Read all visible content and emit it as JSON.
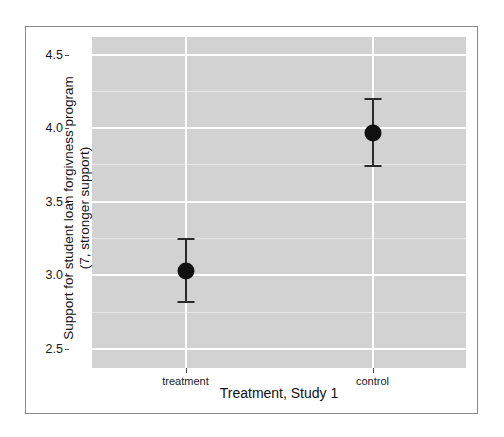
{
  "chart_data": {
    "type": "scatter",
    "title": "",
    "subtitle": "",
    "xlabel": "Treatment, Study 1",
    "ylabel_line1": "Support for student loan forgivness program",
    "ylabel_line2": "(7, stronger support)",
    "categories": [
      "treatment",
      "control"
    ],
    "values": [
      3.03,
      3.97
    ],
    "error_low": [
      2.82,
      3.74
    ],
    "error_high": [
      3.25,
      4.2
    ],
    "error_type": "95% confidence interval",
    "ylim": [
      2.37,
      4.62
    ],
    "yticks": [
      2.5,
      3.0,
      3.5,
      4.0,
      4.5
    ],
    "ytick_labels": [
      "2.5",
      "3.0",
      "3.5",
      "4.0",
      "4.5"
    ],
    "yticks_minor": [
      2.75,
      3.25,
      3.75,
      4.25
    ],
    "grid": true,
    "grid_color": "#ffffff",
    "panel_background": "#d2d2d2",
    "point_color": "#111111",
    "errorbar_color": "#2b2b2b",
    "legend": null,
    "legend_position": "none",
    "series": [
      {
        "name": "Mean support",
        "points": [
          {
            "category": "treatment",
            "value": 3.03,
            "low": 2.82,
            "high": 3.25
          },
          {
            "category": "control",
            "value": 3.97,
            "low": 3.74,
            "high": 4.2
          }
        ]
      }
    ]
  },
  "axes": {
    "y_tick_labels": [
      "4.5",
      "4.0",
      "3.5",
      "3.0",
      "2.5"
    ],
    "x_tick_labels": [
      "treatment",
      "control"
    ],
    "x_title": "Treatment, Study 1",
    "y_title_line1": "Support for student loan forgivness program",
    "y_title_line2": "(7, stronger support)"
  }
}
